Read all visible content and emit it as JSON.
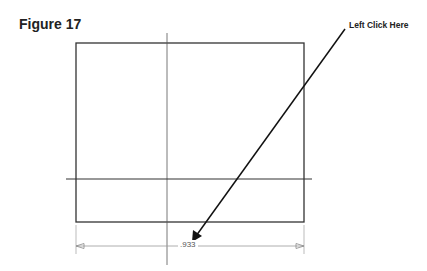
{
  "figure": {
    "title": "Figure 17"
  },
  "callout": {
    "label": "Left Click Here",
    "target": "dimension-value"
  },
  "drawing": {
    "rectangle": {
      "x1": 76,
      "y1": 43,
      "x2": 304,
      "y2": 222
    },
    "vertical_centerline_x": 167,
    "horizontal_line_y": 179,
    "dimension": {
      "value": ".933",
      "y": 246,
      "x_start": 76,
      "x_end": 304
    }
  },
  "colors": {
    "geometry": "#333333",
    "dimension": "#9a9a9a",
    "arrow": "#111111"
  }
}
